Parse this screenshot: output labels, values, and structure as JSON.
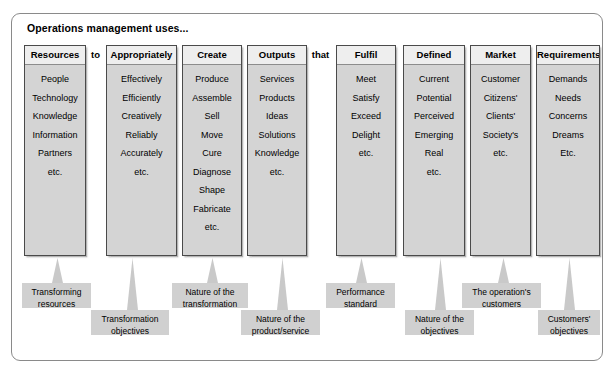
{
  "diagram": {
    "title": "Operations management  uses...",
    "columns": [
      {
        "header": "Resources",
        "items": [
          "People",
          "Technology",
          "Knowledge",
          "Information",
          "Partners",
          "etc."
        ],
        "x": 24,
        "width": 62
      },
      {
        "header": "Appropriately",
        "items": [
          "Effectively",
          "Efficiently",
          "Creatively",
          "Reliably",
          "Accurately",
          "etc."
        ],
        "x": 106,
        "width": 71
      },
      {
        "header": "Create",
        "items": [
          "Produce",
          "Assemble",
          "Sell",
          "Move",
          "Cure",
          "Diagnose",
          "Shape",
          "Fabricate",
          "etc."
        ],
        "x": 182,
        "width": 60
      },
      {
        "header": "Outputs",
        "items": [
          "Services",
          "Products",
          "Ideas",
          "Solutions",
          "Knowledge",
          "etc."
        ],
        "x": 247,
        "width": 60
      },
      {
        "header": "Fulfil",
        "items": [
          "Meet",
          "Satisfy",
          "Exceed",
          "Delight",
          "etc."
        ],
        "x": 336,
        "width": 60
      },
      {
        "header": "Defined",
        "items": [
          "Current",
          "Potential",
          "Perceived",
          "Emerging",
          "Real",
          "etc."
        ],
        "x": 403,
        "width": 62
      },
      {
        "header": "Market",
        "items": [
          "Customer",
          "Citizens'",
          "Clients'",
          "Society's",
          "etc."
        ],
        "x": 470,
        "width": 61
      },
      {
        "header": "Requirements",
        "items": [
          "Demands",
          "Needs",
          "Concerns",
          "Dreams",
          "Etc."
        ],
        "x": 536,
        "width": 64
      }
    ],
    "connectors": [
      {
        "label": "to",
        "x": 87,
        "width": 17
      },
      {
        "label": "that",
        "x": 308,
        "width": 25
      }
    ],
    "callouts": [
      {
        "lines": [
          "Transforming",
          "resources"
        ],
        "box_x": 22,
        "box_y": 283,
        "box_width": 69,
        "box_height": 25,
        "arrow_x": 51,
        "arrow_y": 258,
        "arrow_height": 25
      },
      {
        "lines": [
          "Transformation",
          "objectives"
        ],
        "box_x": 91,
        "box_y": 310,
        "box_width": 78,
        "box_height": 25,
        "arrow_x": 126,
        "arrow_y": 258,
        "arrow_height": 52
      },
      {
        "lines": [
          "Nature of the",
          "transformation"
        ],
        "box_x": 172,
        "box_y": 283,
        "box_width": 76,
        "box_height": 25,
        "arrow_x": 206,
        "arrow_y": 258,
        "arrow_height": 25
      },
      {
        "lines": [
          "Nature of the",
          "product/service"
        ],
        "box_x": 241,
        "box_y": 310,
        "box_width": 79,
        "box_height": 25,
        "arrow_x": 276,
        "arrow_y": 258,
        "arrow_height": 52
      },
      {
        "lines": [
          "Performance",
          "standard"
        ],
        "box_x": 326,
        "box_y": 283,
        "box_width": 69,
        "box_height": 25,
        "arrow_x": 355,
        "arrow_y": 258,
        "arrow_height": 25
      },
      {
        "lines": [
          "Nature of the",
          "objectives"
        ],
        "box_x": 405,
        "box_y": 310,
        "box_width": 69,
        "box_height": 25,
        "arrow_x": 434,
        "arrow_y": 258,
        "arrow_height": 52
      },
      {
        "lines": [
          "The operation's",
          "customers"
        ],
        "box_x": 462,
        "box_y": 283,
        "box_width": 79,
        "box_height": 25,
        "arrow_x": 497,
        "arrow_y": 258,
        "arrow_height": 25
      },
      {
        "lines": [
          "Customers'",
          "objectives"
        ],
        "box_x": 538,
        "box_y": 310,
        "box_width": 62,
        "box_height": 25,
        "arrow_x": 563,
        "arrow_y": 258,
        "arrow_height": 52
      }
    ],
    "caption": ""
  },
  "colors": {
    "column_fill": "#d4d4d4",
    "column_header_fill": "#eeeeee",
    "column_border": "#4a4a4a",
    "callout_fill": "#d0d0d0",
    "arrow_fill": "#c9c9c9",
    "frame_border": "#8a8a8a",
    "text": "#000000"
  }
}
